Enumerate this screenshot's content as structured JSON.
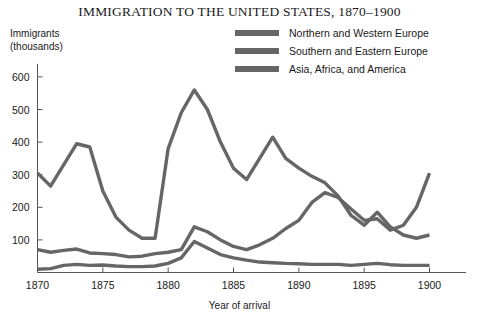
{
  "chart_data": {
    "type": "line",
    "title": "IMMIGRATION TO THE UNITED STATES, 1870–1900",
    "xlabel": "Year of arrival",
    "ylabel": "Immigrants\n(thousands)",
    "xlim": [
      1870,
      1900
    ],
    "ylim": [
      0,
      640
    ],
    "xticks": [
      1870,
      1875,
      1880,
      1885,
      1890,
      1895,
      1900
    ],
    "yticks": [
      100,
      200,
      300,
      400,
      500,
      600
    ],
    "grid": false,
    "legend_position": "top-right",
    "series_color": "#666666",
    "x": [
      1870,
      1871,
      1872,
      1873,
      1874,
      1875,
      1876,
      1877,
      1878,
      1879,
      1880,
      1881,
      1882,
      1883,
      1884,
      1885,
      1886,
      1887,
      1888,
      1889,
      1890,
      1891,
      1892,
      1893,
      1894,
      1895,
      1896,
      1897,
      1898,
      1899,
      1900
    ],
    "series": [
      {
        "name": "Northern and Western Europe",
        "values": [
          305,
          265,
          330,
          395,
          385,
          250,
          170,
          130,
          105,
          105,
          380,
          490,
          560,
          500,
          400,
          320,
          285,
          350,
          415,
          350,
          320,
          295,
          275,
          235,
          175,
          145,
          185,
          140,
          115,
          105,
          115
        ]
      },
      {
        "name": "Southern and Eastern Europe",
        "values": [
          70,
          62,
          68,
          72,
          60,
          58,
          55,
          48,
          50,
          58,
          62,
          70,
          140,
          125,
          100,
          80,
          70,
          85,
          105,
          135,
          160,
          215,
          245,
          230,
          195,
          160,
          165,
          130,
          145,
          200,
          305
        ]
      },
      {
        "name": "Asia, Africa, and America",
        "values": [
          10,
          12,
          22,
          25,
          22,
          23,
          20,
          18,
          18,
          20,
          28,
          45,
          95,
          75,
          55,
          45,
          38,
          32,
          30,
          28,
          27,
          25,
          25,
          25,
          22,
          25,
          28,
          24,
          22,
          22,
          22
        ]
      }
    ]
  }
}
